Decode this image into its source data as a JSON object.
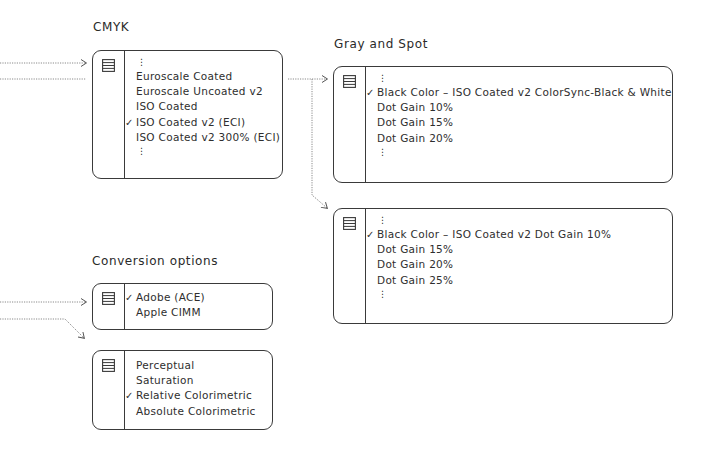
{
  "sections": {
    "cmyk": {
      "title": "CMYK",
      "items": [
        {
          "label": "⋮",
          "type": "ellipsis"
        },
        {
          "label": "Euroscale Coated",
          "checked": false
        },
        {
          "label": "Euroscale Uncoated v2",
          "checked": false
        },
        {
          "label": "ISO Coated",
          "checked": false
        },
        {
          "label": "ISO Coated v2 (ECI)",
          "checked": true
        },
        {
          "label": "ISO Coated v2 300% (ECI)",
          "checked": false
        },
        {
          "label": "⋮",
          "type": "ellipsis"
        }
      ]
    },
    "gray_spot": {
      "title": "Gray and Spot",
      "menus": [
        {
          "items": [
            {
              "label": "⋮",
              "type": "ellipsis"
            },
            {
              "label": "Black Color – ISO Coated v2 ColorSync-Black & White",
              "checked": true
            },
            {
              "label": "Dot Gain 10%",
              "checked": false
            },
            {
              "label": "Dot Gain 15%",
              "checked": false
            },
            {
              "label": "Dot Gain 20%",
              "checked": false
            },
            {
              "label": "⋮",
              "type": "ellipsis"
            }
          ]
        },
        {
          "items": [
            {
              "label": "⋮",
              "type": "ellipsis"
            },
            {
              "label": "Black Color – ISO Coated v2 Dot Gain 10%",
              "checked": true
            },
            {
              "label": "Dot Gain 15%",
              "checked": false
            },
            {
              "label": "Dot Gain 20%",
              "checked": false
            },
            {
              "label": "Dot Gain 25%",
              "checked": false
            },
            {
              "label": "⋮",
              "type": "ellipsis"
            }
          ]
        }
      ]
    },
    "conversion": {
      "title": "Conversion options",
      "menus": [
        {
          "items": [
            {
              "label": "Adobe (ACE)",
              "checked": true
            },
            {
              "label": "Apple CIMM",
              "checked": false
            }
          ]
        },
        {
          "items": [
            {
              "label": "Perceptual",
              "checked": false
            },
            {
              "label": "Saturation",
              "checked": false
            },
            {
              "label": "Relative Colorimetric",
              "checked": true
            },
            {
              "label": "Absolute Colorimetric",
              "checked": false
            }
          ]
        }
      ]
    }
  },
  "icons": {
    "menu": "list-menu-icon",
    "check": "✓"
  },
  "colors": {
    "stroke": "#3a3a3a",
    "connector": "#8a8a8a",
    "text": "#2a2a2a"
  }
}
